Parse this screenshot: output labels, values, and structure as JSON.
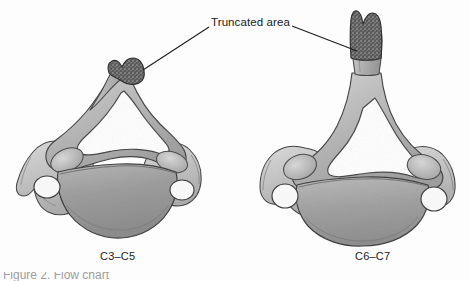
{
  "figure": {
    "background_color": "#fdfdfd",
    "ink_color": "#1a1a1a",
    "bone_fill_light": "#d9d9d9",
    "bone_fill_mid": "#a8a8a8",
    "bone_fill_dark": "#8a8a8a",
    "truncated_fill": "#4a4a4a",
    "outline_color": "#3a3a3a"
  },
  "callouts": [
    {
      "id": "truncated-area",
      "label": "Truncated area",
      "leader_left": "from text left edge down-left to left spinous process tip",
      "leader_right": "from text right edge to right spinous process truncated surface"
    }
  ],
  "specimens": [
    {
      "id": "left-vertebra",
      "caption": "C3–C5",
      "description": "Superior view of a typical mid-cervical vertebra with short bifid spinous process truncated at its tip"
    },
    {
      "id": "right-vertebra",
      "caption": "C6–C7",
      "description": "Superior view of a lower cervical vertebra with a long spinous process truncated at its tip"
    }
  ],
  "figure_caption": {
    "partial_text": "Figure 2.  Flow chart"
  }
}
